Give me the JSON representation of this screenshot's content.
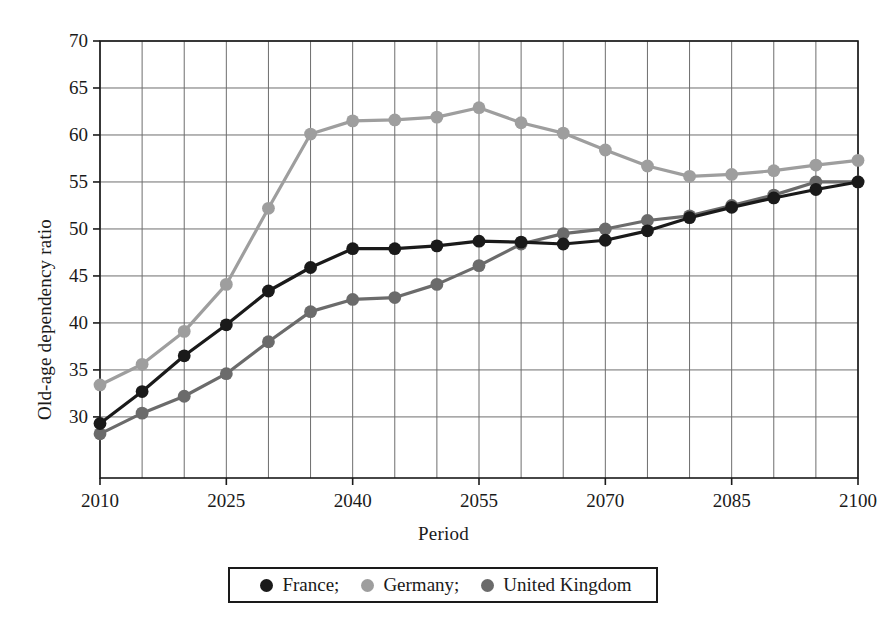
{
  "chart_data": {
    "type": "line",
    "title": "",
    "xlabel": "Period",
    "ylabel": "Old-age dependency ratio",
    "x": [
      2010,
      2015,
      2020,
      2025,
      2030,
      2035,
      2040,
      2045,
      2050,
      2055,
      2060,
      2065,
      2070,
      2075,
      2080,
      2085,
      2090,
      2095,
      2100
    ],
    "x_tick_labels": [
      "2010",
      "2025",
      "2040",
      "2055",
      "2070",
      "2085",
      "2100"
    ],
    "x_tick_values": [
      2010,
      2025,
      2040,
      2055,
      2070,
      2085,
      2100
    ],
    "y_tick_labels": [
      "30",
      "35",
      "40",
      "45",
      "50",
      "55",
      "60",
      "65",
      "70"
    ],
    "y_tick_values": [
      30,
      35,
      40,
      45,
      50,
      55,
      60,
      65,
      70
    ],
    "xlim": [
      2010,
      2100
    ],
    "ylim": [
      23.5,
      70
    ],
    "grid": true,
    "legend_position": "bottom-center",
    "series": [
      {
        "name": "France;",
        "color": "#1a1a1a",
        "values": [
          29.3,
          32.7,
          36.5,
          39.8,
          43.4,
          45.9,
          47.9,
          47.9,
          48.2,
          48.7,
          48.6,
          48.4,
          48.8,
          49.8,
          51.2,
          52.3,
          53.3,
          54.2,
          55.0
        ]
      },
      {
        "name": "Germany;",
        "color": "#9e9e9e",
        "values": [
          33.4,
          35.6,
          39.1,
          44.1,
          52.2,
          60.1,
          61.5,
          61.6,
          61.9,
          62.9,
          61.3,
          60.2,
          58.4,
          56.7,
          55.6,
          55.8,
          56.2,
          56.8,
          57.3
        ]
      },
      {
        "name": "United Kingdom",
        "color": "#6b6b6b",
        "values": [
          28.2,
          30.4,
          32.2,
          34.6,
          38.0,
          41.2,
          42.5,
          42.7,
          44.1,
          46.1,
          48.4,
          49.5,
          50.0,
          50.9,
          51.4,
          52.5,
          53.6,
          55.0,
          55.0
        ]
      }
    ]
  },
  "legend": {
    "items": [
      {
        "label": "France;",
        "color": "#1a1a1a",
        "icon": "circle-marker-icon"
      },
      {
        "label": "Germany;",
        "color": "#9e9e9e",
        "icon": "circle-marker-icon"
      },
      {
        "label": "United Kingdom",
        "color": "#6b6b6b",
        "icon": "circle-marker-icon"
      }
    ]
  },
  "axes": {
    "x_title": "Period",
    "y_title": "Old-age dependency ratio"
  },
  "colors": {
    "axis": "#1a1a1a",
    "grid": "#6e6e6e",
    "background": "#ffffff",
    "france": "#1a1a1a",
    "germany": "#9e9e9e",
    "united_kingdom": "#6b6b6b"
  }
}
